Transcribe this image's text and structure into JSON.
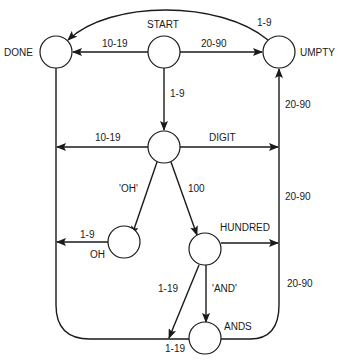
{
  "diagram": {
    "type": "state-transition-network",
    "nodes": [
      {
        "id": "start",
        "label": "START"
      },
      {
        "id": "done",
        "label": "DONE"
      },
      {
        "id": "umpty",
        "label": "UMPTY"
      },
      {
        "id": "digit",
        "label": "DIGIT"
      },
      {
        "id": "oh",
        "label": "OH"
      },
      {
        "id": "hundred",
        "label": "HUNDRED"
      },
      {
        "id": "ands",
        "label": "ANDS"
      }
    ],
    "edges": [
      {
        "from": "start",
        "to": "done",
        "label": "10-19"
      },
      {
        "from": "start",
        "to": "umpty",
        "label": "20-90"
      },
      {
        "from": "umpty",
        "to": "done",
        "label": "1-9"
      },
      {
        "from": "start",
        "to": "digit",
        "label": "1-9"
      },
      {
        "from": "digit",
        "to": "done",
        "label": "10-19"
      },
      {
        "from": "digit",
        "to": "umpty",
        "label": "20-90"
      },
      {
        "from": "digit",
        "to": "oh",
        "label": "'OH'"
      },
      {
        "from": "digit",
        "to": "hundred",
        "label": "100"
      },
      {
        "from": "oh",
        "to": "done",
        "label": "1-9"
      },
      {
        "from": "hundred",
        "to": "umpty",
        "label": "20-90"
      },
      {
        "from": "hundred",
        "to": "done",
        "label": "1-19"
      },
      {
        "from": "hundred",
        "to": "ands",
        "label": "'AND'"
      },
      {
        "from": "ands",
        "to": "done",
        "label": "1-19"
      },
      {
        "from": "ands",
        "to": "umpty",
        "label": "20-90"
      }
    ]
  },
  "labels": {
    "start": "START",
    "done": "DONE",
    "umpty": "UMPTY",
    "digit": "DIGIT",
    "oh": "OH",
    "hundred": "HUNDRED",
    "ands": "ANDS",
    "start_done": "10-19",
    "start_umpty": "20-90",
    "umpty_done": "1-9",
    "start_digit": "1-9",
    "digit_done": "10-19",
    "digit_oh": "'OH'",
    "digit_hundred": "100",
    "oh_done": "1-9",
    "hundred_done": "1-19",
    "hundred_ands": "'AND'",
    "ands_done": "1-19",
    "umpty_in_1": "20-90",
    "umpty_in_2": "20-90",
    "umpty_in_3": "20-90"
  }
}
